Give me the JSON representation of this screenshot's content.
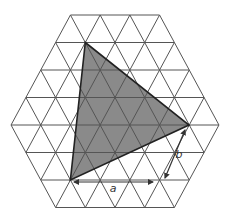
{
  "figure": {
    "colors": {
      "background": "#ffffff",
      "grid_line": "#555555",
      "triangle_fill": "#8a8a8a",
      "triangle_stroke": "#222222",
      "arrow": "#333333"
    },
    "lattice": {
      "center_x": 115,
      "center_y": 125,
      "unit_x": 29.7,
      "row_height": 27.5,
      "rows": [
        {
          "k": -4,
          "cells": 3
        },
        {
          "k": -3,
          "cells": 4
        },
        {
          "k": -2,
          "cells": 5
        },
        {
          "k": -1,
          "cells": 6
        },
        {
          "k": 0,
          "cells": 7
        },
        {
          "k": 1,
          "cells": 6
        },
        {
          "k": 2,
          "cells": 5
        },
        {
          "k": 3,
          "cells": 4
        }
      ]
    },
    "shaded_triangle": {
      "vertices": [
        [
          85.3,
          42.5
        ],
        [
          189,
          125
        ],
        [
          70.4,
          180
        ]
      ]
    },
    "measures": [
      {
        "name": "a",
        "label": "a",
        "from": [
          74,
          182
        ],
        "to": [
          153,
          182
        ],
        "label_pos": [
          113,
          192
        ]
      },
      {
        "name": "b",
        "label": "b",
        "from": [
          185,
          130
        ],
        "to": [
          165,
          178
        ],
        "label_pos": [
          179,
          158
        ]
      }
    ]
  }
}
